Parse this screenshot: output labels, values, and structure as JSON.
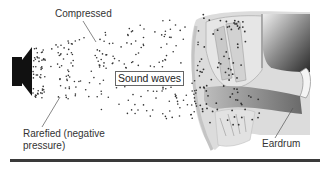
{
  "diagram": {
    "labels": {
      "compressed": "Compressed",
      "sound_waves": "Sound waves",
      "rarefied_line1": "Rarefied (negative",
      "rarefied_line2": "pressure)",
      "eardrum": "Eardrum"
    },
    "elements": [
      "speaker-icon",
      "sound-wave-particles",
      "ear-anatomy",
      "bottom-rule"
    ],
    "colors": {
      "speaker": "#111111",
      "dots": "#333333",
      "ear_light": "#d8d8d8",
      "ear_dark": "#555555",
      "rule": "#3a3a3a"
    }
  }
}
